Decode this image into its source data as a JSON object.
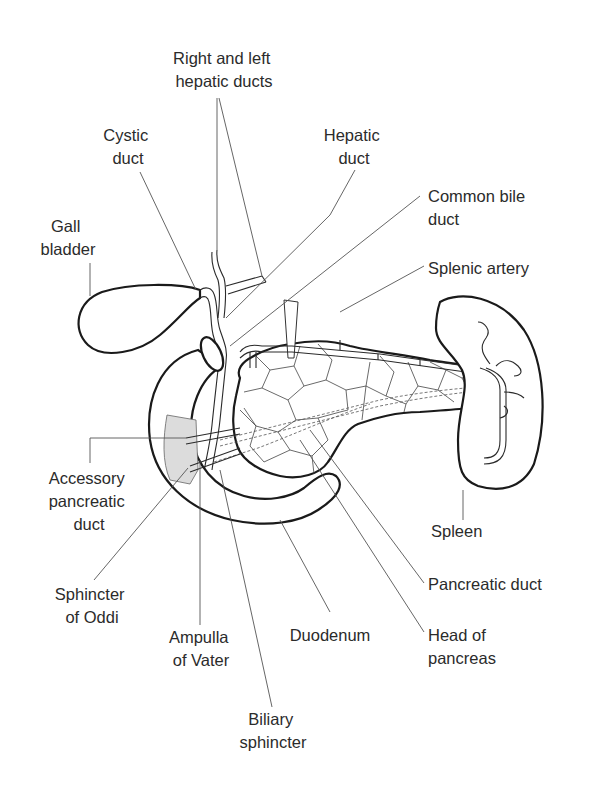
{
  "diagram": {
    "labels": {
      "right_left_hepatic": [
        "Right and left",
        "hepatic ducts"
      ],
      "cystic_duct": [
        "Cystic",
        "duct"
      ],
      "hepatic_duct": [
        "Hepatic",
        "duct"
      ],
      "common_bile_duct": [
        "Common bile",
        "duct"
      ],
      "gall_bladder": [
        "Gall",
        "bladder"
      ],
      "splenic_artery": [
        "Splenic artery"
      ],
      "accessory_pancreatic_duct": [
        "Accessory",
        "pancreatic",
        "duct"
      ],
      "spleen": [
        "Spleen"
      ],
      "sphincter_of_oddi": [
        "Sphincter",
        "of Oddi"
      ],
      "pancreatic_duct": [
        "Pancreatic duct"
      ],
      "ampulla_of_vater": [
        "Ampulla",
        "of Vater"
      ],
      "duodenum": [
        "Duodenum"
      ],
      "head_of_pancreas": [
        "Head of",
        "pancreas"
      ],
      "biliary_sphincter": [
        "Biliary",
        "sphincter"
      ]
    },
    "colors": {
      "outline": "#1a1a1a",
      "text": "#2b2b2b",
      "leader": "#555555",
      "shaded_region": "#dcdcdc"
    }
  }
}
